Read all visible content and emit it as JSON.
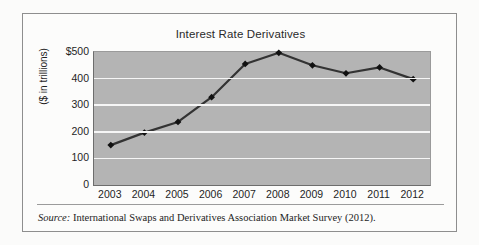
{
  "figure": {
    "title": "Interest Rate Derivatives",
    "source_label": "Source:",
    "source_text": "International Swaps and Derivatives Association Market Survey (2012)."
  },
  "axes": {
    "y_title": "($ in trillions)",
    "y_ticks": [
      "$500",
      "400",
      "300",
      "200",
      "100",
      "0"
    ],
    "x_ticks": [
      "2003",
      "2004",
      "2005",
      "2006",
      "2007",
      "2008",
      "2009",
      "2010",
      "2011",
      "2012"
    ]
  },
  "colors": {
    "plot_background": "#b4b4b4",
    "gridline": "#f6f6f6",
    "series_line": "#333333",
    "marker": "#111111",
    "frame": "#8e8e8e"
  },
  "chart_data": {
    "type": "line",
    "title": "Interest Rate Derivatives",
    "xlabel": "",
    "ylabel": "($ in trillions)",
    "categories": [
      "2003",
      "2004",
      "2005",
      "2006",
      "2007",
      "2008",
      "2009",
      "2010",
      "2011",
      "2012"
    ],
    "values": [
      150,
      197,
      237,
      330,
      455,
      497,
      450,
      420,
      442,
      398
    ],
    "ylim": [
      0,
      500
    ],
    "ytick_values": [
      0,
      100,
      200,
      300,
      400,
      500
    ],
    "grid": true,
    "legend": "none",
    "marker": "diamond",
    "series": [
      {
        "name": "Interest rate derivatives notional outstanding",
        "values": [
          150,
          197,
          237,
          330,
          455,
          497,
          450,
          420,
          442,
          398
        ]
      }
    ],
    "source": "International Swaps and Derivatives Association Market Survey (2012)."
  }
}
